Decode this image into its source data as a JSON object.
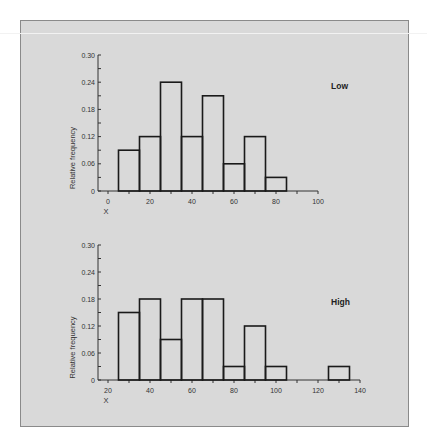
{
  "chart_data": [
    {
      "type": "bar",
      "subtype": "histogram",
      "title": "Low",
      "xlabel": "X",
      "ylabel": "Relative frequency",
      "xlim": [
        0,
        100
      ],
      "ylim": [
        0,
        0.3
      ],
      "xticks": [
        0,
        20,
        40,
        60,
        80,
        100
      ],
      "xtick_labels": [
        "0",
        "20",
        "40",
        "60",
        "80",
        "100"
      ],
      "yticks": [
        0,
        0.06,
        0.12,
        0.18,
        0.24,
        0.3
      ],
      "ytick_labels": [
        "0",
        "0.06",
        "0.12",
        "0.18",
        "0.24",
        "0.30"
      ],
      "bin_width": 10,
      "bins": [
        {
          "from": 5,
          "to": 15,
          "value": 0.09
        },
        {
          "from": 15,
          "to": 25,
          "value": 0.12
        },
        {
          "from": 25,
          "to": 35,
          "value": 0.24
        },
        {
          "from": 35,
          "to": 45,
          "value": 0.12
        },
        {
          "from": 45,
          "to": 55,
          "value": 0.21
        },
        {
          "from": 55,
          "to": 65,
          "value": 0.06
        },
        {
          "from": 65,
          "to": 75,
          "value": 0.12
        },
        {
          "from": 75,
          "to": 85,
          "value": 0.03
        }
      ],
      "categories": [
        "5-15",
        "15-25",
        "25-35",
        "35-45",
        "45-55",
        "55-65",
        "65-75",
        "75-85"
      ],
      "values": [
        0.09,
        0.12,
        0.24,
        0.12,
        0.21,
        0.06,
        0.12,
        0.03
      ]
    },
    {
      "type": "bar",
      "subtype": "histogram",
      "title": "High",
      "xlabel": "X",
      "ylabel": "Relative frequency",
      "xlim": [
        20,
        140
      ],
      "ylim": [
        0,
        0.3
      ],
      "xticks": [
        20,
        40,
        60,
        80,
        100,
        120,
        140
      ],
      "xtick_labels": [
        "20",
        "40",
        "60",
        "80",
        "100",
        "120",
        "140"
      ],
      "yticks": [
        0,
        0.06,
        0.12,
        0.18,
        0.24,
        0.3
      ],
      "ytick_labels": [
        "0",
        "0.06",
        "0.12",
        "0.18",
        "0.24",
        "0.30"
      ],
      "bin_width": 10,
      "bins": [
        {
          "from": 25,
          "to": 35,
          "value": 0.15
        },
        {
          "from": 35,
          "to": 45,
          "value": 0.18
        },
        {
          "from": 45,
          "to": 55,
          "value": 0.09
        },
        {
          "from": 55,
          "to": 65,
          "value": 0.18
        },
        {
          "from": 65,
          "to": 75,
          "value": 0.18
        },
        {
          "from": 75,
          "to": 85,
          "value": 0.03
        },
        {
          "from": 85,
          "to": 95,
          "value": 0.12
        },
        {
          "from": 95,
          "to": 105,
          "value": 0.03
        },
        {
          "from": 125,
          "to": 135,
          "value": 0.03
        }
      ],
      "categories": [
        "25-35",
        "35-45",
        "45-55",
        "55-65",
        "65-75",
        "75-85",
        "85-95",
        "95-105",
        "125-135"
      ],
      "values": [
        0.15,
        0.18,
        0.09,
        0.18,
        0.18,
        0.03,
        0.12,
        0.03,
        0.03
      ]
    }
  ]
}
